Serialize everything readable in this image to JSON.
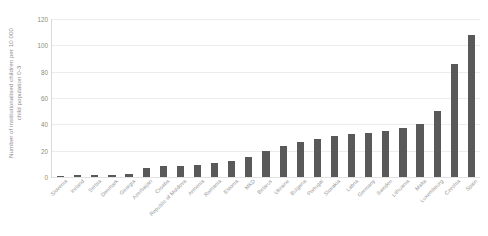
{
  "chart_data": {
    "type": "bar",
    "title": "",
    "xlabel": "",
    "ylabel": "Number of institutionalised children per 10 000 child population 0-3",
    "ylabel_lines": [
      "Number of institutionalised children per 10 000",
      "child population 0-3"
    ],
    "ylim": [
      0,
      120
    ],
    "yticks": [
      0,
      20,
      40,
      60,
      80,
      100,
      120
    ],
    "ytick_labels": [
      "0",
      "20",
      "40",
      "60",
      "80",
      "100",
      "120"
    ],
    "grid": true,
    "legend": "none",
    "bar_color": "#595959",
    "gridline_color": "#ededed",
    "axis_color": "#d9d9d9",
    "label_color": "#8c8c8c",
    "categories": [
      "Slovenia",
      "Ireland",
      "Serbia",
      "Denmark",
      "Georgia",
      "Azerbaijan",
      "Croatia",
      "Republic of Moldova",
      "Armenia",
      "Romania",
      "Estonia",
      "MKD",
      "Belarus",
      "Ukraine",
      "Bulgaria",
      "Portugal",
      "Slovakia",
      "Latvia",
      "Germany",
      "Sweden",
      "Lithuania",
      "Malta",
      "Luxembourg",
      "Czechia",
      "Spain"
    ],
    "values": [
      0.4,
      1.2,
      1.8,
      1.6,
      2.6,
      7.0,
      8.0,
      8.2,
      9.5,
      10.5,
      11.8,
      15.5,
      19.5,
      23.5,
      26.5,
      28.5,
      31.5,
      33.0,
      33.5,
      35.0,
      37.5,
      40.0,
      50.0,
      86.0,
      108.0
    ],
    "series_extra": {
      "note_hungary_value": 86.0,
      "note_hungary_label": "Hungary"
    }
  },
  "axis": {
    "y_title_line1": "Number of institutionalised children per 10 000",
    "y_title_line2": "child population 0-3"
  }
}
